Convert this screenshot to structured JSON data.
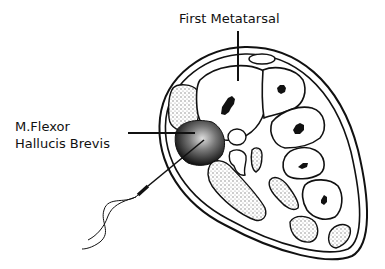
{
  "diagram": {
    "labels": {
      "first_metatarsal": "First Metatarsal",
      "muscle_line1": "M.Flexor",
      "muscle_line2": "Hallucis Brevis"
    },
    "colors": {
      "ink": "#111111",
      "background": "#ffffff",
      "stipple": "#bdbdbd"
    }
  }
}
